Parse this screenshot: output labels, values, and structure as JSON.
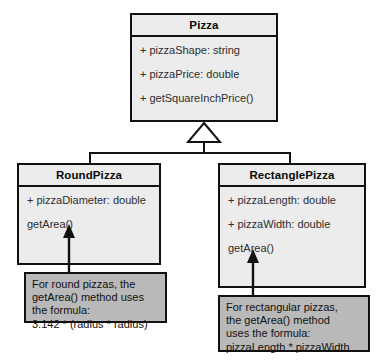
{
  "diagram": {
    "colors": {
      "class_fill": "#ececec",
      "note_fill": "#b9b9b9",
      "stroke": "#111111",
      "background": "#ffffff"
    },
    "classes": [
      {
        "id": "pizza",
        "name": "Pizza",
        "members": [
          "+ pizzaShape: string",
          "+ pizzaPrice: double",
          "+ getSquareInchPrice()"
        ]
      },
      {
        "id": "round-pizza",
        "name": "RoundPizza",
        "members": [
          "+ pizzaDiameter: double",
          "getArea()"
        ]
      },
      {
        "id": "rectangle-pizza",
        "name": "RectanglePizza",
        "members": [
          "+ pizzaLength: double",
          "+ pizzaWidth: double",
          "getArea()"
        ]
      }
    ],
    "notes": [
      {
        "id": "round-note",
        "lines": [
          "For round pizzas, the",
          "getArea() method uses",
          "the formula:",
          "3.142 * (radius * radius)"
        ]
      },
      {
        "id": "rectangle-note",
        "lines": [
          "For rectangular pizzas,",
          "the getArea() method",
          "uses the formula:",
          "pizzaLength * pizzaWidth"
        ]
      }
    ],
    "relationships": {
      "generalization_label": "RoundPizza and RectanglePizza inherit from Pizza"
    }
  }
}
